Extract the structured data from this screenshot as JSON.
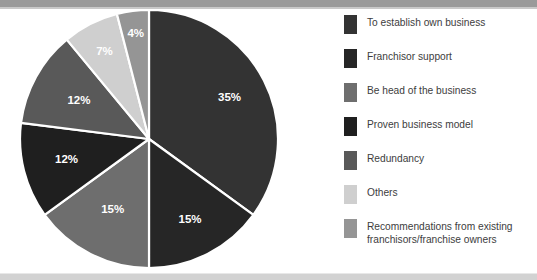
{
  "chart_data": {
    "type": "pie",
    "title": "",
    "subtitle": "",
    "xlabel": "",
    "ylabel": "",
    "legend_position": "right",
    "grid": false,
    "start_angle_deg": 0,
    "direction": "clockwise",
    "categories": [
      "To establish own business",
      "Franchisor support",
      "Be head of the business",
      "Proven business model",
      "Redundancy",
      "Others",
      "Recommendations from existing franchisors/franchise owners"
    ],
    "values": [
      35,
      15,
      15,
      12,
      12,
      7,
      4
    ],
    "value_labels": [
      "35%",
      "15%",
      "15%",
      "12%",
      "12%",
      "7%",
      "4%"
    ],
    "colors": [
      "#333333",
      "#262626",
      "#6e6e6e",
      "#1f1f1f",
      "#595959",
      "#cfcfcf",
      "#959595"
    ]
  },
  "slices": [
    {
      "label": "35%",
      "value": 35,
      "color": "#333333",
      "name": "To establish own business"
    },
    {
      "label": "15%",
      "value": 15,
      "color": "#262626",
      "name": "Franchisor support"
    },
    {
      "label": "15%",
      "value": 15,
      "color": "#6e6e6e",
      "name": "Be head of the business"
    },
    {
      "label": "12%",
      "value": 12,
      "color": "#1f1f1f",
      "name": "Proven business model"
    },
    {
      "label": "12%",
      "value": 12,
      "color": "#595959",
      "name": "Redundancy"
    },
    {
      "label": "7%",
      "value": 7,
      "color": "#cfcfcf",
      "name": "Others"
    },
    {
      "label": "4%",
      "value": 4,
      "color": "#959595",
      "name": "Recommendations from existing franchisors/franchise owners"
    }
  ],
  "legend": {
    "items": [
      {
        "label": "To establish own business",
        "color": "#333333"
      },
      {
        "label": "Franchisor support",
        "color": "#262626"
      },
      {
        "label": "Be head of the business",
        "color": "#6e6e6e"
      },
      {
        "label": "Proven business model",
        "color": "#1f1f1f"
      },
      {
        "label": "Redundancy",
        "color": "#595959"
      },
      {
        "label": "Others",
        "color": "#cfcfcf"
      },
      {
        "label": "Recommendations from existing\nfranchisors/franchise owners",
        "color": "#959595"
      }
    ]
  },
  "theme": {
    "background": "#ffffff",
    "top_bar": "#9a9a9a",
    "bottom_bar": "#d2d2d2",
    "slice_separator": "#ffffff",
    "label_text": "#ffffff",
    "legend_text": "#3d3d3d"
  }
}
